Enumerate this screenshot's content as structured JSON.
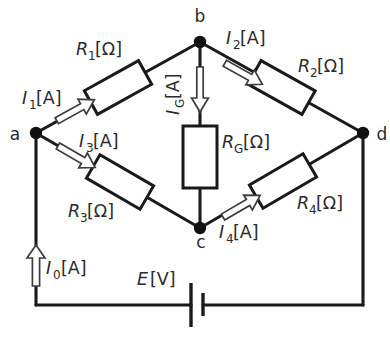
{
  "figure": {
    "background_color": "#ffffff",
    "line_color": "#1a1a1a",
    "text_color": "#2b2b2b",
    "arrow_fill": "#ffffff",
    "arrow_stroke": "#3c3c3c"
  },
  "nodes": [
    {
      "id": "a",
      "label": "a",
      "x": 36,
      "y": 133
    },
    {
      "id": "b",
      "label": "b",
      "x": 200,
      "y": 42
    },
    {
      "id": "c",
      "label": "c",
      "x": 200,
      "y": 228
    },
    {
      "id": "d",
      "label": "d",
      "x": 363,
      "y": 133
    }
  ],
  "resistors": [
    {
      "id": "R1",
      "symbol": "R",
      "subscript": "1",
      "unit": "[Ω]",
      "label": "R1[Ω]",
      "between": "a-b"
    },
    {
      "id": "R2",
      "symbol": "R",
      "subscript": "2",
      "unit": "[Ω]",
      "label": "R2[Ω]",
      "between": "b-d"
    },
    {
      "id": "R3",
      "symbol": "R",
      "subscript": "3",
      "unit": "[Ω]",
      "label": "R3[Ω]",
      "between": "a-c"
    },
    {
      "id": "R4",
      "symbol": "R",
      "subscript": "4",
      "unit": "[Ω]",
      "label": "R4[Ω]",
      "between": "c-d"
    },
    {
      "id": "RG",
      "symbol": "R",
      "subscript": "G",
      "unit": "[Ω]",
      "label": "RG[Ω]",
      "between": "b-c"
    }
  ],
  "currents": [
    {
      "id": "I1",
      "symbol": "I",
      "subscript": "1",
      "unit": "[A]",
      "label": "I1[A]",
      "direction": "a-to-b"
    },
    {
      "id": "I2",
      "symbol": "I",
      "subscript": "2",
      "unit": "[A]",
      "label": "I2[A]",
      "direction": "b-to-d"
    },
    {
      "id": "I3",
      "symbol": "I",
      "subscript": "3",
      "unit": "[A]",
      "label": "I3[A]",
      "direction": "a-to-c"
    },
    {
      "id": "I4",
      "symbol": "I",
      "subscript": "4",
      "unit": "[A]",
      "label": "I4[A]",
      "direction": "c-to-d"
    },
    {
      "id": "IG",
      "symbol": "I",
      "subscript": "G",
      "unit": "[A]",
      "label": "IG[A]",
      "direction": "b-to-c"
    },
    {
      "id": "I0",
      "symbol": "I",
      "subscript": "0",
      "unit": "[A]",
      "label": "I0[A]",
      "direction": "upward-into-a"
    }
  ],
  "source": {
    "id": "E",
    "symbol": "E",
    "unit": "[V]",
    "label": "E[V]",
    "type": "battery"
  },
  "labels": {
    "node_a": "a",
    "node_b": "b",
    "node_c": "c",
    "node_d": "d",
    "r1_sym": "R",
    "r1_sub": "1",
    "r1_unit": "[Ω]",
    "r2_sym": "R",
    "r2_sub": "2",
    "r2_unit": "[Ω]",
    "r3_sym": "R",
    "r3_sub": "3",
    "r3_unit": "[Ω]",
    "r4_sym": "R",
    "r4_sub": "4",
    "r4_unit": "[Ω]",
    "rg_sym": "R",
    "rg_sub": "G",
    "rg_unit": "[Ω]",
    "i1_sym": "I",
    "i1_sub": "1",
    "i1_unit": "[A]",
    "i2_sym": "I",
    "i2_sub": "2",
    "i2_unit": "[A]",
    "i3_sym": "I",
    "i3_sub": "3",
    "i3_unit": "[A]",
    "i4_sym": "I",
    "i4_sub": "4",
    "i4_unit": "[A]",
    "ig_sym": "I",
    "ig_sub": "G",
    "ig_unit": "[A]",
    "i0_sym": "I",
    "i0_sub": "0",
    "i0_unit": "[A]",
    "e_sym": "E",
    "e_unit": "[V]"
  }
}
